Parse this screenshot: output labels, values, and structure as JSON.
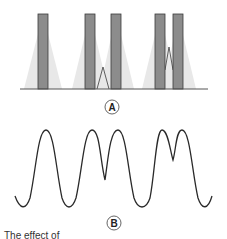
{
  "figure": {
    "panel_a": {
      "label": "A",
      "description": "Three pairs/groups of dark vertical bars with light grey diffraction cones on a baseline",
      "groups": [
        {
          "bars": [
            {
              "x": 38,
              "width": 10
            }
          ],
          "overlap_peak": null
        },
        {
          "bars": [
            {
              "x": 85,
              "width": 10
            },
            {
              "x": 111,
              "width": 10
            }
          ],
          "overlap_peak": {
            "x": 103,
            "top": 67
          }
        },
        {
          "bars": [
            {
              "x": 155,
              "width": 10
            },
            {
              "x": 173,
              "width": 10
            }
          ],
          "overlap_peak": {
            "x": 169,
            "top": 47
          }
        }
      ],
      "bar_top": 14,
      "baseline_y": 89,
      "colors": {
        "bar_fill": "#8c8c8c",
        "bar_stroke": "#3a3a3a",
        "cone": "#e6e6e6",
        "baseline": "#555555"
      }
    },
    "panel_b": {
      "label": "B",
      "description": "Intensity wave with single peak, then double peaks with deep dip, then double peaks with shallow dip",
      "color": "#2a2a2a"
    },
    "caption": "The effect of"
  }
}
